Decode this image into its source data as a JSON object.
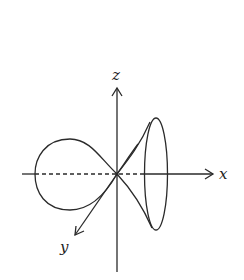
{
  "diagram": {
    "axes": {
      "x": {
        "label": "x"
      },
      "y": {
        "label": "y"
      },
      "z": {
        "label": "z"
      }
    },
    "colors": {
      "stroke": "#2a2a2a",
      "background": "#ffffff"
    }
  }
}
